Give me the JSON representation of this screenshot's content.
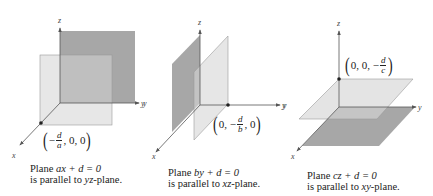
{
  "figures": [
    {
      "id": "plane-ax",
      "axes": {
        "x": "x",
        "y": "y",
        "z": "z"
      },
      "point_label": {
        "prefix": "−",
        "num": "d",
        "den": "a",
        "rest": ", 0, 0"
      },
      "caption": {
        "line1_pre": "Plane ",
        "line1_eq_var": "ax",
        "line1_eq_rest": " + d = 0",
        "line2_pre": "is parallel to ",
        "line2_plane": "yz",
        "line2_post": "-plane."
      },
      "colors": {
        "back_plane": "#a9a9a9",
        "front_plane": "#d9d9d9"
      }
    },
    {
      "id": "plane-by",
      "axes": {
        "x": "x",
        "y": "y",
        "y_left": "y",
        "z": "z"
      },
      "point_label": {
        "pre": "0, −",
        "num": "d",
        "den": "b",
        "rest": ", 0"
      },
      "caption": {
        "line1_pre": "Plane ",
        "line1_eq_var": "by",
        "line1_eq_rest": " + d = 0",
        "line2_pre": "is parallel to ",
        "line2_plane": "xz",
        "line2_post": "-plane."
      },
      "colors": {
        "back_plane": "#a9a9a9",
        "front_plane": "#dcdcdc"
      }
    },
    {
      "id": "plane-cz",
      "axes": {
        "x": "x",
        "y": "y",
        "y_left": "y",
        "z": "z"
      },
      "point_label": {
        "pre": "0, 0, −",
        "num": "d",
        "den": "c"
      },
      "caption": {
        "line1_pre": "Plane ",
        "line1_eq_var": "cz",
        "line1_eq_rest": " + d = 0",
        "line2_pre": "is parallel to ",
        "line2_plane": "xy",
        "line2_post": "-plane."
      },
      "colors": {
        "back_plane": "#a9a9a9",
        "front_plane": "#dadada"
      }
    }
  ]
}
